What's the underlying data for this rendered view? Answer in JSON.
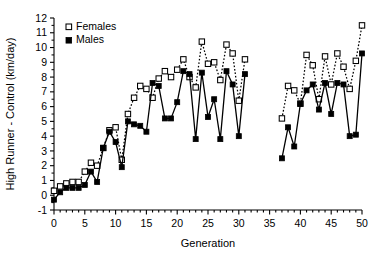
{
  "chart_data": {
    "type": "line",
    "title": "",
    "xlabel": "Generation",
    "ylabel": "High Runner - Control (km/day)",
    "xlim": [
      0,
      50
    ],
    "ylim": [
      -1,
      12
    ],
    "xticks": [
      0,
      5,
      10,
      15,
      20,
      25,
      30,
      35,
      40,
      45,
      50
    ],
    "xtick_labels": [
      "0",
      "5",
      "10",
      "15",
      "20",
      "25",
      "30",
      "35",
      "40",
      "45",
      "50"
    ],
    "x_minor_tick_interval": 1,
    "yticks": [
      -1,
      0,
      1,
      2,
      3,
      4,
      5,
      6,
      7,
      8,
      9,
      10,
      11,
      12
    ],
    "ytick_labels": [
      "-1",
      "0",
      "1",
      "2",
      "3",
      "4",
      "5",
      "6",
      "7",
      "8",
      "9",
      "10",
      "11",
      "12"
    ],
    "grid": false,
    "legend_position": "top-left",
    "data_gap_generations": [
      32,
      33,
      34,
      35,
      36
    ],
    "series": [
      {
        "name": "Females",
        "marker": "open-square",
        "line_style": "dotted",
        "color": "#000000",
        "x": [
          0,
          1,
          2,
          3,
          4,
          5,
          6,
          7,
          8,
          9,
          10,
          11,
          12,
          13,
          14,
          15,
          16,
          17,
          18,
          19,
          20,
          21,
          22,
          23,
          24,
          25,
          26,
          27,
          28,
          29,
          30,
          31,
          37,
          38,
          39,
          40,
          41,
          42,
          43,
          44,
          45,
          46,
          47,
          48,
          49,
          50
        ],
        "y": [
          0.3,
          0.6,
          0.8,
          0.9,
          0.9,
          1.6,
          2.2,
          2.0,
          3.2,
          4.4,
          4.6,
          2.4,
          5.5,
          6.6,
          7.4,
          7.2,
          6.6,
          7.9,
          8.4,
          8.0,
          8.5,
          9.2,
          8.0,
          7.3,
          10.4,
          8.9,
          9.0,
          7.8,
          10.2,
          9.6,
          6.4,
          9.2,
          5.2,
          7.4,
          7.1,
          6.2,
          9.5,
          8.8,
          6.5,
          9.4,
          7.5,
          9.6,
          8.7,
          7.2,
          9.1,
          11.5
        ]
      },
      {
        "name": "Males",
        "marker": "filled-square",
        "line_style": "solid",
        "color": "#000000",
        "x": [
          0,
          1,
          2,
          3,
          4,
          5,
          6,
          7,
          8,
          9,
          10,
          11,
          12,
          13,
          14,
          15,
          16,
          17,
          18,
          19,
          20,
          21,
          22,
          23,
          24,
          25,
          26,
          27,
          28,
          29,
          30,
          31,
          37,
          38,
          39,
          40,
          41,
          42,
          43,
          44,
          45,
          46,
          47,
          48,
          49,
          50
        ],
        "y": [
          -0.3,
          0.2,
          0.5,
          0.5,
          0.5,
          0.7,
          1.6,
          0.9,
          3.2,
          4.3,
          3.6,
          1.9,
          5.0,
          4.8,
          4.7,
          4.3,
          7.6,
          7.4,
          5.2,
          5.2,
          6.3,
          8.4,
          8.2,
          3.8,
          8.3,
          5.3,
          6.5,
          3.8,
          8.4,
          7.5,
          4.0,
          8.2,
          2.5,
          4.6,
          3.3,
          6.2,
          7.1,
          7.5,
          5.8,
          7.6,
          5.5,
          7.6,
          7.5,
          4.0,
          4.1,
          9.6
        ]
      }
    ]
  },
  "legend": {
    "items": [
      {
        "label": "Females",
        "marker": "open-square"
      },
      {
        "label": "Males",
        "marker": "filled-square"
      }
    ]
  }
}
